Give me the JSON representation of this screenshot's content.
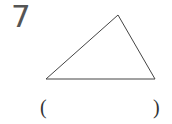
{
  "problem": {
    "number": "7",
    "open_paren": "(",
    "close_paren": ")",
    "answer": ""
  },
  "figure": {
    "shape": "triangle",
    "vertices": [
      [
        46,
        79
      ],
      [
        118,
        15
      ],
      [
        155,
        79
      ]
    ],
    "stroke": "#444444"
  }
}
